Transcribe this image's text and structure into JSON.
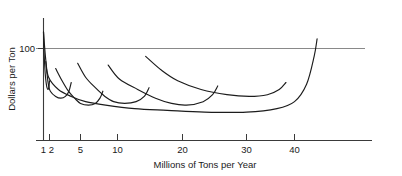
{
  "chart_data": {
    "type": "line",
    "title": "",
    "xlabel": "Millions of Tons per Year",
    "ylabel": "Dollars per Ton",
    "xscale": "log",
    "xlim": [
      0.95,
      50
    ],
    "ylim": [
      60,
      130
    ],
    "grid": false,
    "legend": null,
    "xticks": [
      1,
      2,
      5,
      10,
      20,
      30,
      40
    ],
    "xtick_labels": [
      "1",
      "2",
      "5",
      "10",
      "20",
      "30",
      "40"
    ],
    "yticks": [
      100
    ],
    "ytick_labels": [
      "100"
    ],
    "reference_lines": [
      {
        "name": "hundred-dollar-line",
        "orientation": "horizontal",
        "value": 100,
        "label": "100"
      }
    ],
    "series": [
      {
        "name": "short-run-curve-1",
        "kind": "short-run-average-cost",
        "points": [
          [
            1.0,
            122
          ],
          [
            1.05,
            113
          ],
          [
            1.12,
            105
          ],
          [
            1.22,
            98
          ],
          [
            1.35,
            93
          ],
          [
            1.5,
            90
          ],
          [
            1.68,
            89
          ],
          [
            1.85,
            90
          ],
          [
            2.0,
            94
          ]
        ]
      },
      {
        "name": "short-run-curve-2",
        "kind": "short-run-average-cost",
        "points": [
          [
            1.3,
            105
          ],
          [
            1.5,
            98
          ],
          [
            1.75,
            92
          ],
          [
            2.05,
            88
          ],
          [
            2.4,
            85
          ],
          [
            2.8,
            84
          ],
          [
            3.2,
            85
          ],
          [
            3.55,
            88
          ],
          [
            3.8,
            93
          ]
        ]
      },
      {
        "name": "short-run-curve-3",
        "kind": "short-run-average-cost",
        "points": [
          [
            2.4,
            101
          ],
          [
            2.9,
            94
          ],
          [
            3.5,
            88
          ],
          [
            4.2,
            84
          ],
          [
            5.0,
            81
          ],
          [
            5.8,
            80
          ],
          [
            6.6,
            81
          ],
          [
            7.2,
            84
          ],
          [
            7.6,
            88
          ]
        ]
      },
      {
        "name": "short-run-curve-4",
        "kind": "short-run-average-cost",
        "points": [
          [
            4.6,
            104
          ],
          [
            5.5,
            96
          ],
          [
            6.6,
            90
          ],
          [
            7.9,
            85
          ],
          [
            9.3,
            82
          ],
          [
            10.8,
            81
          ],
          [
            12.2,
            82
          ],
          [
            13.3,
            85
          ],
          [
            14.0,
            90
          ]
        ]
      },
      {
        "name": "short-run-curve-5",
        "kind": "short-run-average-cost",
        "points": [
          [
            8.4,
            103
          ],
          [
            10.2,
            95
          ],
          [
            12.4,
            89
          ],
          [
            15.0,
            84
          ],
          [
            17.8,
            81
          ],
          [
            20.5,
            80
          ],
          [
            22.8,
            82
          ],
          [
            24.2,
            86
          ],
          [
            25.0,
            91
          ]
        ]
      },
      {
        "name": "short-run-curve-6",
        "kind": "short-run-average-cost",
        "points": [
          [
            13.5,
            108
          ],
          [
            16.0,
            100
          ],
          [
            19.0,
            94
          ],
          [
            22.5,
            89
          ],
          [
            26.5,
            86
          ],
          [
            30.5,
            85
          ],
          [
            34.0,
            86
          ],
          [
            36.5,
            89
          ],
          [
            38.0,
            93
          ]
        ]
      },
      {
        "name": "long-run-envelope-curve",
        "kind": "long-run-average-cost",
        "points": [
          [
            1.0,
            122
          ],
          [
            1.3,
            106
          ],
          [
            1.8,
            96
          ],
          [
            2.6,
            89
          ],
          [
            3.8,
            85
          ],
          [
            5.5,
            82
          ],
          [
            8.0,
            80
          ],
          [
            12.0,
            78
          ],
          [
            17.0,
            77
          ],
          [
            23.0,
            76
          ],
          [
            30.0,
            76
          ],
          [
            36.0,
            78
          ],
          [
            40.0,
            82
          ],
          [
            43.0,
            92
          ],
          [
            45.0,
            108
          ],
          [
            45.8,
            118
          ]
        ]
      }
    ]
  },
  "axes": {
    "x_title": "Millions of Tons per Year",
    "y_title": "Dollars per Ton",
    "y_tick_label": "100"
  },
  "ticks": {
    "x": [
      {
        "label": "1",
        "value": 1
      },
      {
        "label": "2",
        "value": 2
      },
      {
        "label": "5",
        "value": 5
      },
      {
        "label": "10",
        "value": 10
      },
      {
        "label": "20",
        "value": 20
      },
      {
        "label": "30",
        "value": 30
      },
      {
        "label": "40",
        "value": 40
      }
    ]
  }
}
